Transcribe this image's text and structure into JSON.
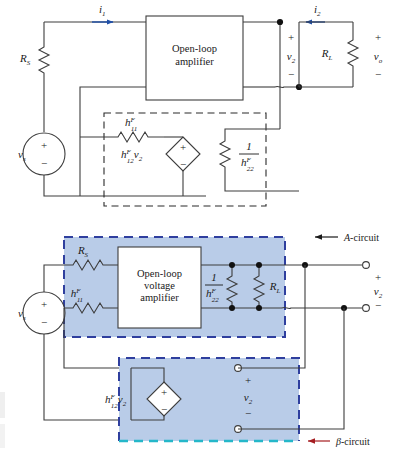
{
  "figure": {
    "title_top": "h-parameter feedback equivalent circuit",
    "title_bottom": "A-circuit and beta-circuit decomposition"
  },
  "colors": {
    "wire": "#3d3d3d",
    "label": "#1a1a1a",
    "current_arrow": "#1f4fa8",
    "dash_black": "#2b2b2b",
    "block_fill": "#b9cce8",
    "block_fill_light": "#c7d7ee",
    "a_circuit_dash": "#2f3f9e",
    "beta_circuit_dash": "#2f3f9e",
    "beta_circuit_dash_bottom": "#25b7c9",
    "arrow_a": "#1a1a1a",
    "arrow_beta": "#a51d21",
    "node": "#111111",
    "terminal_fill": "#ffffff",
    "page_bg": "#ffffff"
  },
  "top_circuit": {
    "name": "h-parameter-feedback-circuit",
    "amplifier_block": {
      "line1": "Open-loop",
      "line2": "amplifier"
    },
    "source": {
      "label": "v",
      "sub": "s",
      "plus": "+",
      "minus": "−"
    },
    "components": [
      {
        "name": "source-resistance",
        "label": "R",
        "sub": "S"
      },
      {
        "name": "load-resistance",
        "label": "R",
        "sub": "L"
      },
      {
        "name": "feedback-h11",
        "label": "h",
        "sub": "11",
        "sup": "F"
      },
      {
        "name": "feedback-h22-inverse",
        "numerator": "1",
        "label": "h",
        "sub": "22",
        "sup": "F"
      }
    ],
    "dependent_source": {
      "label": "h",
      "sub": "12",
      "sup": "F",
      "times": "v",
      "times_sub": "2",
      "plus": "+",
      "minus": "−"
    },
    "currents": [
      {
        "name": "input-current",
        "label": "i",
        "sub": "1"
      },
      {
        "name": "output-current",
        "label": "i",
        "sub": "2"
      }
    ],
    "voltages": [
      {
        "name": "v2-voltage",
        "label": "v",
        "sub": "2",
        "plus": "+",
        "minus": "−"
      },
      {
        "name": "vo-voltage",
        "label": "v",
        "sub": "o",
        "plus": "+",
        "minus": "−"
      }
    ]
  },
  "bottom_circuit": {
    "name": "a-circuit-beta-circuit",
    "amplifier_block": {
      "line1": "Open-loop",
      "line2": "voltage",
      "line3": "amplifier"
    },
    "source": {
      "label": "v",
      "sub": "s",
      "plus": "+",
      "minus": "−"
    },
    "a_circuit": {
      "annotation": "A-circuit",
      "annotation_italic": "A",
      "annotation_rest": "-circuit",
      "components": [
        {
          "name": "source-resistance",
          "label": "R",
          "sub": "S"
        },
        {
          "name": "feedback-h11",
          "label": "h",
          "sub": "11",
          "sup": "F"
        },
        {
          "name": "feedback-h22-inverse",
          "numerator": "1",
          "label": "h",
          "sub": "22",
          "sup": "F"
        },
        {
          "name": "load-resistance",
          "label": "R",
          "sub": "L"
        }
      ],
      "output_voltage": {
        "label": "v",
        "sub": "2",
        "plus": "+",
        "minus": "−"
      }
    },
    "beta_circuit": {
      "annotation": "β-circuit",
      "annotation_italic": "β",
      "annotation_rest": "-circuit",
      "dependent_source": {
        "label": "h",
        "sub": "12",
        "sup": "F",
        "times": "v",
        "times_sub": "2",
        "plus": "+",
        "minus": "−"
      },
      "port_voltage": {
        "label": "v",
        "sub": "2",
        "plus": "+",
        "minus": "−"
      }
    }
  }
}
